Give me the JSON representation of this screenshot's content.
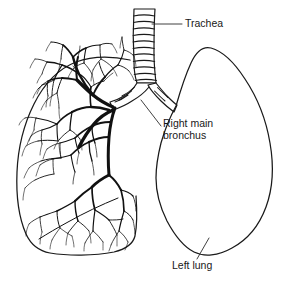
{
  "figure": {
    "background_color": "#ffffff",
    "ink_color": "#111111",
    "width": 287,
    "height": 282
  },
  "labels": {
    "trachea": {
      "text": "Trachea",
      "x": 185,
      "y": 24
    },
    "right_main_bronchus": {
      "line1": "Right main",
      "line2": "bronchus",
      "x": 163,
      "y_line1": 124,
      "y_line2": 136
    },
    "left_lung": {
      "text": "Left lung",
      "x": 172,
      "y": 266
    }
  },
  "structures": {
    "trachea": {
      "name": "trachea",
      "description": "vertical airway tube with cartilage rings",
      "ring_count": 11
    },
    "right_lung": {
      "name": "right-lung",
      "description": "lung containing bronchial tree detail"
    },
    "left_lung": {
      "name": "left-lung",
      "description": "lung shown as plain outline"
    },
    "bronchial_tree": {
      "name": "bronchial-tree",
      "description": "branching airway network filling the right lung"
    }
  }
}
